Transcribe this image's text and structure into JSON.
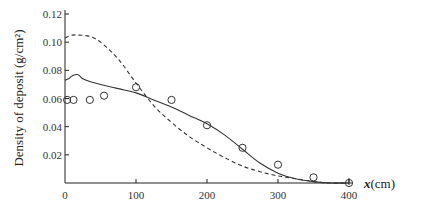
{
  "chart_data": {
    "type": "line",
    "title": "",
    "xlabel": "x(cm)",
    "xlabel_var": "x",
    "xlabel_unit": "(cm)",
    "ylabel": "Density of deposit (g/cm²)",
    "xlim": [
      0,
      400
    ],
    "ylim": [
      0,
      0.12
    ],
    "x_ticks": [
      0,
      100,
      200,
      300,
      400
    ],
    "x_tick_labels": [
      "0",
      "100",
      "200",
      "300",
      "400"
    ],
    "y_ticks": [
      0.02,
      0.04,
      0.06,
      0.08,
      0.1,
      0.12
    ],
    "y_tick_labels": [
      "0.02",
      "0.04",
      "0.06",
      "0.08",
      "0.10",
      "0.12"
    ],
    "grid": false,
    "legend": null,
    "series": [
      {
        "name": "measured",
        "style": "markers-open-circle",
        "x": [
          3,
          12,
          35,
          55,
          100,
          150,
          200,
          250,
          300,
          350,
          400
        ],
        "y": [
          0.059,
          0.059,
          0.059,
          0.062,
          0.068,
          0.059,
          0.041,
          0.025,
          0.013,
          0.004,
          0.0
        ]
      },
      {
        "name": "model-solid",
        "style": "solid",
        "x": [
          0,
          5,
          10,
          18,
          25,
          35,
          50,
          75,
          100,
          125,
          150,
          175,
          200,
          225,
          250,
          275,
          300,
          325,
          350,
          375,
          400
        ],
        "y": [
          0.073,
          0.074,
          0.076,
          0.077,
          0.074,
          0.072,
          0.07,
          0.067,
          0.064,
          0.059,
          0.054,
          0.048,
          0.042,
          0.034,
          0.024,
          0.014,
          0.007,
          0.003,
          0.001,
          0.0,
          0.0
        ]
      },
      {
        "name": "model-dashed",
        "style": "dashed",
        "x": [
          0,
          10,
          20,
          35,
          50,
          75,
          100,
          125,
          150,
          175,
          200,
          225,
          250,
          275,
          300,
          325,
          350,
          375,
          400
        ],
        "y": [
          0.103,
          0.105,
          0.105,
          0.104,
          0.1,
          0.088,
          0.071,
          0.055,
          0.043,
          0.033,
          0.025,
          0.018,
          0.012,
          0.008,
          0.005,
          0.003,
          0.001,
          0.0,
          0.0
        ]
      }
    ]
  },
  "style": {
    "axis_color": "#222222",
    "line_color": "#333333",
    "marker_color": "#333333"
  }
}
